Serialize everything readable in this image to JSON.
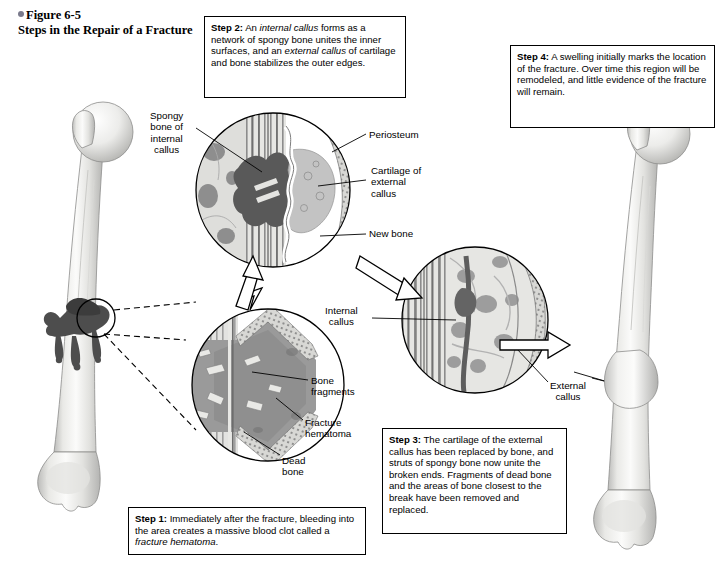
{
  "figure": {
    "number": "Figure 6-5",
    "title": "Steps in the Repair of a Fracture",
    "bullet_color": "#7a7a8c"
  },
  "steps": [
    {
      "id": "step1",
      "label": "Step 1:",
      "text_before": " Immediately after the fracture, bleeding into the area creates a massive blood clot called a ",
      "italic": "fracture hematoma",
      "text_after": "."
    },
    {
      "id": "step2",
      "label": "Step 2:",
      "text_before": " An ",
      "italic": "internal callus",
      "text_mid": " forms as a network of spongy bone unites the inner surfaces, and an ",
      "italic2": "external callus",
      "text_after": " of cartilage and bone stabilizes the outer edges."
    },
    {
      "id": "step3",
      "label": "Step 3:",
      "text_after": " The cartilage of the external callus has been replaced by bone, and struts of spongy bone now unite the broken ends. Fragments of dead bone and the areas of bone closest to the break have been removed and replaced."
    },
    {
      "id": "step4",
      "label": "Step 4:",
      "text_after": " A swelling initially marks the location of the fracture. Over time this region will be remodeled, and little evidence of the fracture will remain."
    }
  ],
  "labels": {
    "spongy_bone": "Spongy\nbone of\ninternal\ncallus",
    "periosteum": "Periosteum",
    "cartilage_external": "Cartilage of\nexternal\ncallus",
    "new_bone": "New bone",
    "internal_callus": "Internal\ncallus",
    "external_callus": "External\ncallus",
    "bone_fragments": "Bone\nfragments",
    "fracture_hematoma": "Fracture\nhematoma",
    "dead_bone": "Dead\nbone"
  },
  "colors": {
    "line": "#000000",
    "bone_light": "#f2f2f0",
    "bone_shade": "#c9c9c7",
    "bone_mid": "#ddddda",
    "clot_dark": "#4a4a4a",
    "callus_gray": "#8d8d8d",
    "cartilage_gray": "#bdbdbd",
    "marrow_gray": "#9a9a9a",
    "background": "#ffffff"
  }
}
